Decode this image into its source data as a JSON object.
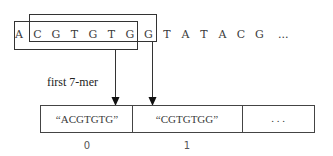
{
  "sequence": {
    "letters": [
      "A",
      "C",
      "G",
      "T",
      "G",
      "T",
      "G",
      "G",
      "T",
      "A",
      "T",
      "A",
      "C",
      "G"
    ],
    "ellipsis": "..."
  },
  "windows": [
    {
      "name": "first-window",
      "start": 0,
      "length": 7
    },
    {
      "name": "second-window",
      "start": 1,
      "length": 7
    }
  ],
  "label": "first 7-mer",
  "array": {
    "cells": [
      {
        "value": "“ACGTGTG”",
        "index": "0"
      },
      {
        "value": "“CGTGTGG”",
        "index": "1"
      },
      {
        "value": ". . .",
        "index": ""
      }
    ]
  }
}
